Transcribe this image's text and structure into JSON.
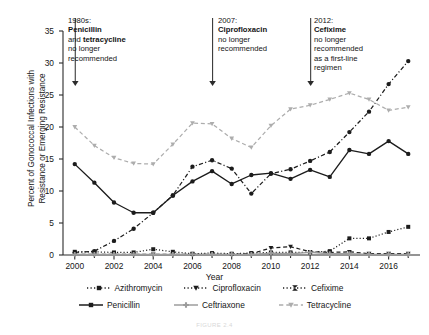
{
  "chart_data": {
    "type": "line",
    "title": "",
    "xlabel": "Year",
    "ylabel": "Percent of Gonococcal Infections with Resistance or Emerging Resistance",
    "ylabel_line1": "Percent of Gonococcal Infections with",
    "ylabel_line2": "Resistance or Emerging Resistance",
    "x": [
      2000,
      2001,
      2002,
      2003,
      2004,
      2005,
      2006,
      2007,
      2008,
      2009,
      2010,
      2011,
      2012,
      2013,
      2014,
      2015,
      2016,
      2017
    ],
    "xlim": [
      1999.4,
      2017.6
    ],
    "ylim": [
      0,
      35
    ],
    "yticks": [
      0,
      5,
      10,
      15,
      20,
      25,
      30,
      35
    ],
    "xticks": [
      2000,
      2002,
      2004,
      2006,
      2008,
      2010,
      2012,
      2014,
      2016
    ],
    "xminor_step": 1,
    "grid": false,
    "legend_position": "below",
    "series": [
      {
        "name": "Azithromycin",
        "color": "#1c1c1c",
        "linestyle": "dotted",
        "marker": "square",
        "values": [
          0.5,
          0.5,
          0.4,
          0.4,
          0.9,
          0.5,
          0.2,
          0.3,
          0.2,
          0.3,
          0.4,
          0.4,
          0.4,
          0.6,
          2.6,
          2.6,
          3.6,
          4.4
        ]
      },
      {
        "name": "Ciprofloxacin",
        "color": "#1c1c1c",
        "linestyle": "dashdot",
        "marker": "circle",
        "values": [
          0.4,
          0.6,
          2.2,
          4.1,
          6.6,
          9.3,
          13.8,
          14.8,
          13.5,
          9.6,
          12.7,
          13.4,
          14.7,
          16.1,
          19.2,
          22.4,
          26.7,
          30.3
        ]
      },
      {
        "name": "Cefixime",
        "color": "#1c1c1c",
        "linestyle": "dashed",
        "marker": "triangle-down",
        "values": [
          0.1,
          0.1,
          0.1,
          0.1,
          0.1,
          0.1,
          0.1,
          0.1,
          0.1,
          0.2,
          1.1,
          1.3,
          0.5,
          0.4,
          0.5,
          0.2,
          0.2,
          0.2
        ]
      },
      {
        "name": "Penicillin",
        "color": "#1c1c1c",
        "linestyle": "solid",
        "marker": "circle",
        "values": [
          14.2,
          11.3,
          8.2,
          6.6,
          6.6,
          9.3,
          11.5,
          13.1,
          11.1,
          12.5,
          12.8,
          11.9,
          13.3,
          12.2,
          16.4,
          15.8,
          17.8,
          15.8
        ]
      },
      {
        "name": "Ceftriaxone",
        "color": "#9c9c9c",
        "linestyle": "solid",
        "marker": "plus",
        "values": [
          0.1,
          0.1,
          0.1,
          0.1,
          0.1,
          0.1,
          0.1,
          0.1,
          0.1,
          0.1,
          0.3,
          0.2,
          0.4,
          0.2,
          0.2,
          0.1,
          0.1,
          0.1
        ]
      },
      {
        "name": "Tetracycline",
        "color": "#adadad",
        "linestyle": "dashed",
        "marker": "triangle-down",
        "values": [
          20.0,
          17.1,
          15.2,
          14.3,
          14.2,
          17.3,
          20.6,
          20.5,
          18.2,
          16.8,
          20.2,
          22.8,
          23.4,
          24.3,
          25.3,
          24.3,
          22.6,
          23.1
        ]
      }
    ],
    "annotations": [
      {
        "x": 2000,
        "lines": [
          {
            "text": "1980s:",
            "bold": false
          },
          {
            "text": "Penicillin",
            "bold": true
          },
          {
            "text": "and tetracycline",
            "bold": "partial",
            "plain_prefix": "and ",
            "bold_part": "tetracycline"
          },
          {
            "text": "no longer",
            "bold": false
          },
          {
            "text": "recommended",
            "bold": false
          }
        ]
      },
      {
        "x": 2007,
        "lines": [
          {
            "text": "2007:",
            "bold": false
          },
          {
            "text": "Ciprofloxacin",
            "bold": true
          },
          {
            "text": "no longer",
            "bold": false
          },
          {
            "text": "recommended",
            "bold": false
          }
        ]
      },
      {
        "x": 2012,
        "lines": [
          {
            "text": "2012:",
            "bold": false
          },
          {
            "text": "Cefixime",
            "bold": true
          },
          {
            "text": "no longer",
            "bold": false
          },
          {
            "text": "recommended",
            "bold": false
          },
          {
            "text": "as a first-line",
            "bold": false
          },
          {
            "text": "regimen",
            "bold": false
          }
        ]
      }
    ]
  },
  "annotation_text": {
    "a1_l1": "1980s:",
    "a1_l2": "Penicillin",
    "a1_l3_plain": "and ",
    "a1_l3_bold": "tetracycline",
    "a1_l4": "no longer",
    "a1_l5": "recommended",
    "a2_l1": "2007:",
    "a2_l2": "Ciprofloxacin",
    "a2_l3": "no longer",
    "a2_l4": "recommended",
    "a3_l1": "2012:",
    "a3_l2": "Cefixime",
    "a3_l3": "no longer",
    "a3_l4": "recommended",
    "a3_l5": "as a first-line",
    "a3_l6": "regimen"
  },
  "axis_labels": {
    "y_line1": "Percent of Gonococcal Infections with",
    "y_line2": "Resistance or Emerging Resistance",
    "x": "Year",
    "yticks": [
      "0",
      "5",
      "10",
      "15",
      "20",
      "25",
      "30",
      "35"
    ],
    "xticks": [
      "2000",
      "2002",
      "2004",
      "2006",
      "2008",
      "2010",
      "2012",
      "2014",
      "2016"
    ]
  },
  "legend": {
    "row1": [
      {
        "label": "Azithromycin",
        "marker": "square",
        "linestyle": "dotted",
        "color": "#1c1c1c"
      },
      {
        "label": "Ciprofloxacin",
        "marker": "triangle-down",
        "linestyle": "dotted",
        "color": "#1c1c1c"
      },
      {
        "label": "Cefixime",
        "marker": "bowtie",
        "linestyle": "dotted",
        "color": "#1c1c1c"
      }
    ],
    "row2": [
      {
        "label": "Penicillin",
        "marker": "square",
        "linestyle": "solid",
        "color": "#1c1c1c"
      },
      {
        "label": "Ceftriaxone",
        "marker": "plus",
        "linestyle": "solid",
        "color": "#9c9c9c"
      },
      {
        "label": "Tetracycline",
        "marker": "triangle-down",
        "linestyle": "dashed",
        "color": "#adadad"
      }
    ]
  },
  "caption": "FIGURE 2.4"
}
